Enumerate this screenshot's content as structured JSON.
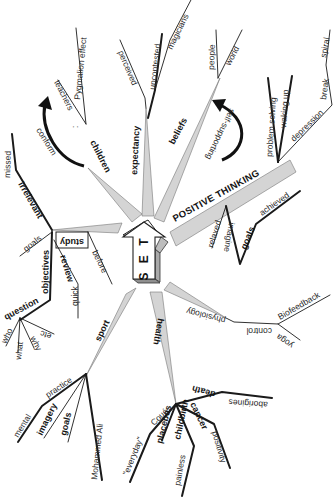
{
  "diagram": {
    "central": {
      "label": "S E T",
      "shape": "3d-arrow-up"
    },
    "colors": {
      "line": "#1a1a1a",
      "spoke_fill": "#d4d4d4",
      "arrow_front": "#ffffff",
      "arrow_side": "#a9a9a9",
      "background": "#ffffff"
    },
    "branches": {
      "children": {
        "label": "children",
        "sub": {
          "dot": ":",
          "teachers": "teachers",
          "pygmalion": "Pygmalion effect"
        },
        "curved_arrow_label": "conform"
      },
      "expectancy": {
        "label": "expectancy",
        "sub": {
          "perceived": "perceived",
          "uncontested": "uncontested",
          "magicians": "magicians"
        }
      },
      "beliefs": {
        "label": "beliefs",
        "sub": {
          "people": "people",
          "world": "world"
        },
        "curved_arrow_label": "self-supporting"
      },
      "positive_thinking": {
        "label": "POSITIVE THINKING",
        "sub": {
          "problem_solving": "problem solving",
          "waking_up": "waking up",
          "depression": "depression",
          "break": "break",
          "spiral": "spiral",
          "relaxed": "relaxed",
          "imagine": "imagine",
          "goals": "goals",
          "achieved": "achieved"
        }
      },
      "health": {
        "label": "health",
        "sub": {
          "physiology": "physiology",
          "control": "control",
          "biofeedback": "Biofeedback",
          "yoga": "yoga",
          "coue": "Coué",
          "everyday": "\"everyday\"",
          "placebos": "placebos",
          "childbirth": "childbirth",
          "painless": "painless",
          "cancer": "cancer",
          "positivity": "positivity",
          "death": "death",
          "aborigines": "aborigines"
        }
      },
      "sport": {
        "label": "sport",
        "sub": {
          "practice": "practice",
          "mental": "mental",
          "imagery": "imagery",
          "goals": "goals",
          "mohammed_ali": "Mohammed Ali"
        }
      },
      "study": {
        "label": "study",
        "sub": {
          "before": "before",
          "irrelevant": "irrelevant",
          "missed": "missed",
          "goals": "goals",
          "objectives": "objectives",
          "review": "review",
          "quick": "quick",
          "question": "question",
          "who": "who",
          "what": "what",
          "why": "why",
          "etc": "etc"
        }
      }
    }
  }
}
